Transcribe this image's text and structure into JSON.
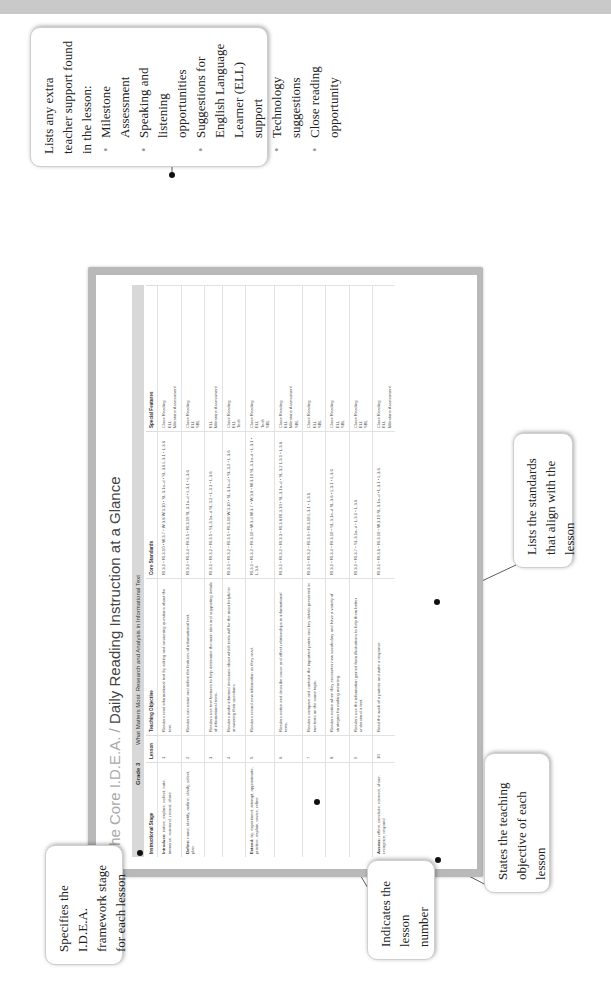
{
  "document": {
    "title_brand": "The Core I.D.E.A.",
    "title_sep": " / ",
    "title_rest": "Daily Reading Instruction at a Glance",
    "grade": "Grade 3",
    "unit_title": "What Matters Most: Research and Analysis in Informational Text",
    "columns": [
      "Instructional Stage",
      "Lesson",
      "Teaching Objective",
      "Core Standards",
      "Special Features"
    ],
    "rows": [
      {
        "stage_label": "Introduce:",
        "stage_text": "notice, explore, collect, note, immerse, surround, record, share",
        "lesson": "1",
        "objective": "Readers read informational text by asking and answering questions about the text.",
        "standards": "RI.3.1 • RI.3.10 • W.3.7 • W.3.8 W.3.10 • SL.3.1a–d • SL.3.6 L.3.1 • L.3.6",
        "features": "Close Reading\nELL\nMilestone Assessment"
      },
      {
        "stage_label": "Define:",
        "stage_text": "name, identify, outline, clarify, select, plan",
        "lesson": "2",
        "objective": "Readers can name and define the features of informational text.",
        "standards": "RI.3.1 • RI.3.4 • RI.3.5 • RI.3.10 SL.3.1a–d • L.3.1 • L.3.6",
        "features": "Close Reading\nELL\nSBL"
      },
      {
        "stage_label": "",
        "stage_text": "",
        "lesson": "3",
        "objective": "Readers use text features to help determine the main idea and supporting details of informational texts.",
        "standards": "RI.3.1 • RI.3.2 • RI.3.5 • SL.3.1a–d SL.3.2 • L.3.1 • L.3.6",
        "features": "ELL\nMilestone Assessment"
      },
      {
        "stage_label": "",
        "stage_text": "",
        "lesson": "4",
        "objective": "Readers make informed decisions about which texts will be the most helpful in answering their questions.",
        "standards": "RI.3.1 • RI.3.2 • RI.3.5 • RI.3.10 W.3.10 • SL.3.1a–d • SL.3.2 • L.3.6",
        "features": "Close Reading\nELL\nTech"
      },
      {
        "stage_label": "Extend:",
        "stage_text": "try, experiment, attempt, approximate, practice, explain, revise, refine",
        "lesson": "5",
        "objective": "Readers record new information as they read.",
        "standards": "RI.3.1 • RI.3.2 • RI.3.10 • W.3.4 W.3.7 • W.3.8 • W.3.10 SL.3.1a–d • L.3.1 • L.3.6",
        "features": "Close Reading\nELL\nTech\nSBL"
      },
      {
        "stage_label": "",
        "stage_text": "",
        "lesson": "6",
        "objective": "Readers notice and describe cause and effect relationships in informational texts.",
        "standards": "RI.3.1 • RI.3.2 • RI.3.3 • RI.3.8 RI.3.10 • SL.3.1a–d • SL.3.2 L.3.1 • L.3.6",
        "features": "Close Reading\nELL\nMilestone Assessment\nSBL"
      },
      {
        "stage_label": "",
        "stage_text": "",
        "lesson": "7",
        "objective": "Readers compare and contrast the important points and key details presented in two texts on the same topic.",
        "standards": "RI.3.1 • RI.3.2 • RI.3.9 • RI.3.10 L.3.1 • L.3.6",
        "features": "Close Reading\nELL\nSBL"
      },
      {
        "stage_label": "",
        "stage_text": "",
        "lesson": "8",
        "objective": "Readers notice when they encounter new vocabulary and have a variety of strategies for making meaning.",
        "standards": "RI.3.1 • RI.3.4 • RI.3.10 • SL.3.1a–d SL.3.6 • L.3.1 • L.3.6",
        "features": "Close Reading\nELL\nSBL"
      },
      {
        "stage_label": "",
        "stage_text": "",
        "lesson": "9",
        "objective": "Readers use the information gained from illustrations to help them better understand a text.",
        "standards": "RI.3.1 • RI.3.7 • SL.3.1a–d • L.3.1 • L.3.6",
        "features": "Close Reading\nELL\nSBL"
      },
      {
        "stage_label": "Assess:",
        "stage_text": "reflect, conclude, connect, share, recognize, respond",
        "lesson": "10",
        "objective": "Read the work of a partner and write a response.",
        "standards": "RI.3.1 • RI.3.6 • RI.3.10 • W.3.10 SL.3.1a–d • L.3.1 • L.3.6",
        "features": "Close Reading\nELL\nMilestone Assessment"
      }
    ]
  },
  "callouts": {
    "special_features": {
      "intro": "Lists any extra teacher support found in the lesson:",
      "items": [
        "Milestone Assessment",
        "Speaking and listening opportunities",
        "Suggestions for English Language Learner (ELL) support",
        "Technology suggestions",
        "Close reading opportunity"
      ]
    },
    "standards": "Lists the standards that align with the lesson",
    "objective": "States the teaching objective of each lesson",
    "lesson_number": "Indicates the lesson number",
    "stage": "Specifies the I.D.E.A. framework stage for each lesson"
  }
}
